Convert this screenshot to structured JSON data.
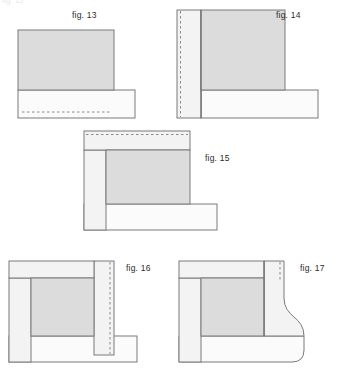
{
  "page": {
    "width": 337,
    "height": 391,
    "background": "#ffffff",
    "partial_top_text": "fig. 12"
  },
  "style": {
    "fill_gray": "#dcdcdc",
    "fill_light": "#f0f0f0",
    "fill_white": "#fbfbfb",
    "stroke": "#7a7a7a",
    "stroke_dark": "#6b6b6b",
    "dash_color": "#8a8a8a",
    "caption_color": "#2b2b2b"
  },
  "figures": [
    {
      "id": "fig13",
      "caption": "fig. 13",
      "caption_x": 72,
      "caption_y": 10,
      "description": "vertical gray panel seated on a white horizontal base board with a dashed line near the base bottom"
    },
    {
      "id": "fig14",
      "caption": "fig. 14",
      "caption_x": 276,
      "caption_y": 10,
      "description": "gray panel with white left strip, vertical dashed line at far left edge, white base board extending right"
    },
    {
      "id": "fig15",
      "caption": "fig. 15",
      "caption_x": 205,
      "caption_y": 153,
      "description": "gray center panel framed by a white top band with dashed line and a white left strip, white base board extending right"
    },
    {
      "id": "fig16",
      "caption": "fig. 16",
      "caption_x": 126,
      "caption_y": 263,
      "description": "gray center panel framed by white top band, left strip and right strip with vertical dashed line, white base board"
    },
    {
      "id": "fig17",
      "caption": "fig. 17",
      "caption_x": 300,
      "caption_y": 263,
      "description": "gray center panel with white frame whose right side sweeps out in an S-curve ogee profile down to the white base board"
    }
  ]
}
